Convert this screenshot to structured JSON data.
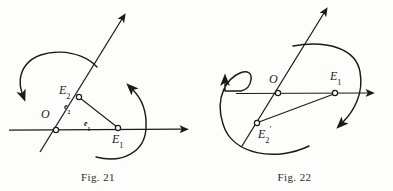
{
  "page": {
    "background_color": "#fdfdfc",
    "ink_color": "#1a1a1a",
    "width": 393,
    "height": 191
  },
  "figures": [
    {
      "id": "fig21",
      "caption": "Fig. 21",
      "labels": {
        "origin": "O",
        "origin_sub": "",
        "e1_point": "E",
        "e1_point_sub": "1",
        "e2_point": "E",
        "e2_point_sub": "2",
        "e1_vector": "e",
        "e1_vector_sub": "1",
        "e2_vector": "e",
        "e2_vector_sub": "2"
      },
      "points": {
        "O": {
          "x": 56,
          "y": 130
        },
        "E1": {
          "x": 118,
          "y": 128
        },
        "E2": {
          "x": 79,
          "y": 97
        }
      },
      "rotation_arrows": [
        {
          "name": "left-rotation-arrow",
          "direction": "counterclockwise-down-left"
        },
        {
          "name": "right-rotation-arrow",
          "direction": "counterclockwise-up-left"
        }
      ]
    },
    {
      "id": "fig22",
      "caption": "Fig. 22",
      "labels": {
        "origin": "O",
        "e1_point": "E",
        "e1_point_sub": "1",
        "e2_point": "E",
        "e2_point_sub": "2",
        "e2_point_prime": "′"
      },
      "points": {
        "O": {
          "x": 82,
          "y": 93
        },
        "E1": {
          "x": 139,
          "y": 93
        },
        "E2p": {
          "x": 61,
          "y": 123
        }
      },
      "rotation_arrows": [
        {
          "name": "left-loop-arrow",
          "direction": "counterclockwise-up"
        },
        {
          "name": "right-rotation-arrow",
          "direction": "clockwise-down-left"
        }
      ]
    }
  ]
}
